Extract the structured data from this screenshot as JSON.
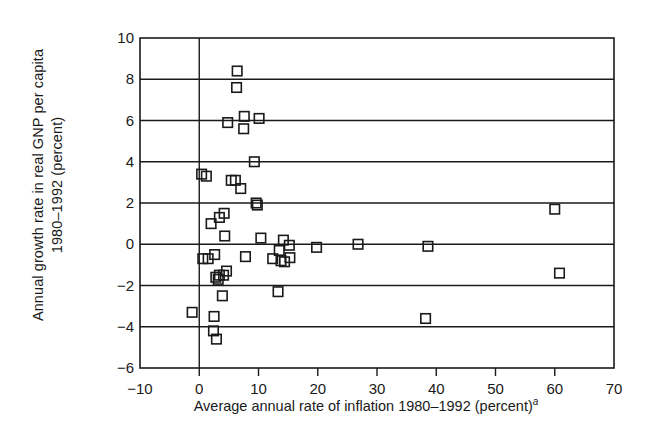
{
  "chart_data": {
    "type": "scatter",
    "title": "",
    "xlabel": "Average annual rate of inflation 1980–1992 (percent)",
    "xlabel_superscript": "a",
    "ylabel_line1": "Annual growth rate in real GNP per capita",
    "ylabel_line2": "1980–1992 (percent)",
    "xlim": [
      -10,
      70
    ],
    "ylim": [
      -6,
      10
    ],
    "xticks": [
      -10,
      0,
      10,
      20,
      30,
      40,
      50,
      60,
      70
    ],
    "xticklabels": [
      "−10",
      "0",
      "10",
      "20",
      "30",
      "40",
      "50",
      "60",
      "70"
    ],
    "yticks": [
      -6,
      -4,
      -2,
      0,
      2,
      4,
      6,
      8,
      10
    ],
    "yticklabels": [
      "−6",
      "−4",
      "−2",
      "0",
      "2",
      "4",
      "6",
      "8",
      "10"
    ],
    "grid": "horizontal",
    "grid_color": "#1a1a1a",
    "marker": "open-square",
    "marker_color": "#1a1a1a",
    "marker_fill": "none",
    "legend": "none",
    "vertical_reference_line_x": 0,
    "points": [
      {
        "x": -1.2,
        "y": -3.3
      },
      {
        "x": 0.4,
        "y": 3.4
      },
      {
        "x": 1.2,
        "y": 3.3
      },
      {
        "x": 0.6,
        "y": -0.7
      },
      {
        "x": 1.5,
        "y": -0.7
      },
      {
        "x": 2.0,
        "y": 1.0
      },
      {
        "x": 2.6,
        "y": -0.5
      },
      {
        "x": 2.8,
        "y": -1.6
      },
      {
        "x": 3.2,
        "y": -1.7
      },
      {
        "x": 3.4,
        "y": -1.5
      },
      {
        "x": 2.5,
        "y": -3.5
      },
      {
        "x": 2.4,
        "y": -4.2
      },
      {
        "x": 2.9,
        "y": -4.6
      },
      {
        "x": 3.4,
        "y": 1.3
      },
      {
        "x": 4.2,
        "y": 1.5
      },
      {
        "x": 4.1,
        "y": -1.5
      },
      {
        "x": 4.6,
        "y": -1.3
      },
      {
        "x": 4.3,
        "y": 0.4
      },
      {
        "x": 3.9,
        "y": -2.5
      },
      {
        "x": 4.8,
        "y": 5.9
      },
      {
        "x": 5.4,
        "y": 3.1
      },
      {
        "x": 6.1,
        "y": 3.1
      },
      {
        "x": 6.4,
        "y": 8.4
      },
      {
        "x": 6.3,
        "y": 7.6
      },
      {
        "x": 7.0,
        "y": 2.7
      },
      {
        "x": 7.6,
        "y": 6.2
      },
      {
        "x": 7.5,
        "y": 5.6
      },
      {
        "x": 7.8,
        "y": -0.6
      },
      {
        "x": 9.3,
        "y": 4.0
      },
      {
        "x": 9.6,
        "y": 2.0
      },
      {
        "x": 9.8,
        "y": 1.9
      },
      {
        "x": 10.1,
        "y": 6.1
      },
      {
        "x": 10.4,
        "y": 0.3
      },
      {
        "x": 12.4,
        "y": -0.7
      },
      {
        "x": 13.5,
        "y": -0.3
      },
      {
        "x": 13.8,
        "y": -0.8
      },
      {
        "x": 14.2,
        "y": 0.2
      },
      {
        "x": 14.4,
        "y": -0.85
      },
      {
        "x": 15.2,
        "y": -0.05
      },
      {
        "x": 15.3,
        "y": -0.65
      },
      {
        "x": 13.3,
        "y": -2.3
      },
      {
        "x": 19.8,
        "y": -0.15
      },
      {
        "x": 26.8,
        "y": 0.0
      },
      {
        "x": 38.6,
        "y": -0.1
      },
      {
        "x": 38.2,
        "y": -3.6
      },
      {
        "x": 60.0,
        "y": 1.7
      },
      {
        "x": 60.8,
        "y": -1.4
      }
    ]
  }
}
